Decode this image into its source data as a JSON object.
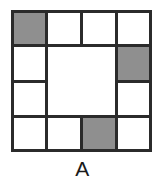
{
  "figure": {
    "caption": "A",
    "colors": {
      "shaded": "#8f8f8f",
      "line": "#2b2b2b",
      "background": "#ffffff"
    },
    "grid": {
      "columns": 4,
      "rows": 4,
      "description": "4 by 4 square grid with a merged 2 by 2 block in the centre"
    },
    "cells": [
      {
        "id": "r1c1",
        "row": 1,
        "col": 1,
        "colspan": 1,
        "rowspan": 1,
        "shaded": true,
        "left": 0,
        "top": 0,
        "width": 36,
        "height": 36
      },
      {
        "id": "r1c2",
        "row": 1,
        "col": 2,
        "colspan": 1,
        "rowspan": 1,
        "shaded": false,
        "left": 35,
        "top": 0,
        "width": 36,
        "height": 36
      },
      {
        "id": "r1c3",
        "row": 1,
        "col": 3,
        "colspan": 1,
        "rowspan": 1,
        "shaded": false,
        "left": 70,
        "top": 0,
        "width": 36,
        "height": 36
      },
      {
        "id": "r1c4",
        "row": 1,
        "col": 4,
        "colspan": 1,
        "rowspan": 1,
        "shaded": false,
        "left": 105,
        "top": 0,
        "width": 36,
        "height": 36
      },
      {
        "id": "r2c1",
        "row": 2,
        "col": 1,
        "colspan": 1,
        "rowspan": 1,
        "shaded": false,
        "left": 0,
        "top": 35,
        "width": 36,
        "height": 37
      },
      {
        "id": "center-block",
        "row": 2,
        "col": 2,
        "colspan": 2,
        "rowspan": 2,
        "shaded": false,
        "left": 35,
        "top": 35,
        "width": 71,
        "height": 72
      },
      {
        "id": "r2c4",
        "row": 2,
        "col": 4,
        "colspan": 1,
        "rowspan": 1,
        "shaded": true,
        "left": 105,
        "top": 35,
        "width": 36,
        "height": 37
      },
      {
        "id": "r3c1",
        "row": 3,
        "col": 1,
        "colspan": 1,
        "rowspan": 1,
        "shaded": false,
        "left": 0,
        "top": 71,
        "width": 36,
        "height": 36
      },
      {
        "id": "r3c4",
        "row": 3,
        "col": 4,
        "colspan": 1,
        "rowspan": 1,
        "shaded": false,
        "left": 105,
        "top": 71,
        "width": 36,
        "height": 36
      },
      {
        "id": "r4c1",
        "row": 4,
        "col": 1,
        "colspan": 1,
        "rowspan": 1,
        "shaded": false,
        "left": 0,
        "top": 106,
        "width": 36,
        "height": 36
      },
      {
        "id": "r4c2",
        "row": 4,
        "col": 2,
        "colspan": 1,
        "rowspan": 1,
        "shaded": false,
        "left": 35,
        "top": 106,
        "width": 36,
        "height": 36
      },
      {
        "id": "r4c3",
        "row": 4,
        "col": 3,
        "colspan": 1,
        "rowspan": 1,
        "shaded": true,
        "left": 70,
        "top": 106,
        "width": 36,
        "height": 36
      },
      {
        "id": "r4c4",
        "row": 4,
        "col": 4,
        "colspan": 1,
        "rowspan": 1,
        "shaded": false,
        "left": 105,
        "top": 106,
        "width": 36,
        "height": 36
      }
    ],
    "shaded_count": 3
  }
}
